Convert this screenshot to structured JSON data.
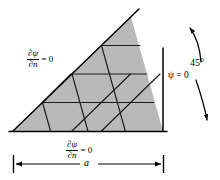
{
  "figure": {
    "domain_fill_color": "#b9b9b9",
    "line_color": "#000000",
    "background_color": "#ffffff"
  },
  "labels": {
    "bc_left": {
      "numerator": "∂ψ",
      "denominator": "∂n",
      "equals": "= 0",
      "full": "∂ψ/∂n = 0"
    },
    "bc_bottom": {
      "numerator": "∂ψ",
      "denominator": "∂n",
      "equals": "= 0",
      "full": "∂ψ/∂n = 0"
    },
    "bc_right": "ψ = 0",
    "angle": "45°",
    "dimension": "a"
  },
  "geometry": {
    "vertex_left": [
      13,
      131
    ],
    "vertex_apex": [
      131,
      17
    ],
    "vertex_right": [
      163,
      131
    ],
    "hypotenuse_extension_end": [
      139,
      9
    ],
    "right_edge_x": 163,
    "baseline_y": 131
  },
  "dimension_line": {
    "y": 164,
    "x_start": 13,
    "x_end": 164,
    "label": "a",
    "has_arrowheads": true,
    "has_end_ticks": true
  },
  "angle_arc": {
    "label": "45°",
    "double_headed": true,
    "upper_arrow_tip": [
      188,
      27
    ],
    "lower_arrow_tip": [
      208,
      122
    ]
  }
}
